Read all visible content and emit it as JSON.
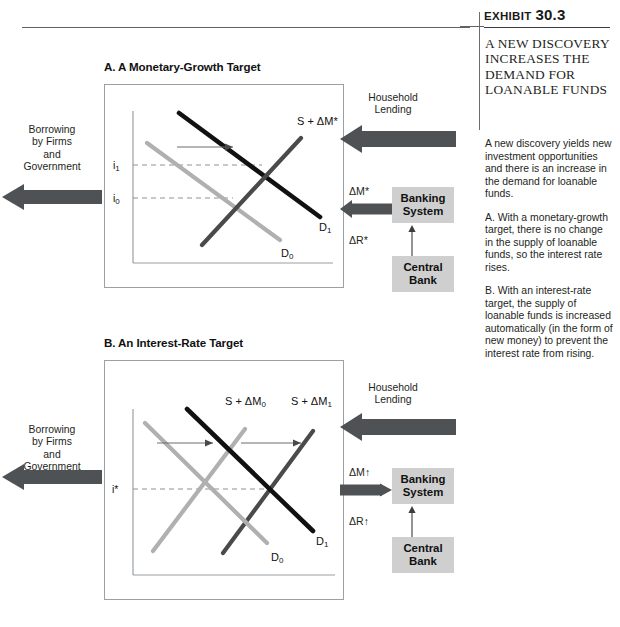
{
  "exhibit": {
    "label": "Exhibit",
    "number": "30.3",
    "title": "A NEW DISCOVERY INCREASES THE DEMAND FOR LOANABLE FUNDS",
    "paragraphs": [
      "A new discovery yields new investment opportunities and there is an increase in the demand for loanable funds.",
      "A. With a monetary-growth target, there is no change in the supply of loanable funds, so the interest rate rises.",
      "B. With an interest-rate target, the supply of loanable funds is increased automatically (in the form of new money) to prevent the interest rate from rising."
    ]
  },
  "panel_a": {
    "title": "A.  A Monetary-Growth Target",
    "left_caption": "Borrowing\nby Firms\nand\nGovernment",
    "flow_caption": "Household\nLending",
    "delta_m": "ΔM*",
    "delta_r": "ΔR*",
    "banking_box": "Banking\nSystem",
    "central_box": "Central\nBank",
    "axis_labels": {
      "i1": "i₁",
      "i0": "i₀"
    },
    "curves": {
      "supply": "S + ΔM*",
      "demand_new": "D₁",
      "demand_old": "D₀"
    }
  },
  "panel_b": {
    "title": "B.  An Interest-Rate Target",
    "left_caption": "Borrowing\nby Firms\nand\nGovernment",
    "flow_caption": "Household\nLending",
    "delta_m": "ΔM↑",
    "delta_r": "ΔR↑",
    "banking_box": "Banking\nSystem",
    "central_box": "Central\nBank",
    "axis_labels": {
      "istar": "i*"
    },
    "curves": {
      "supply_old": "S + ΔM₀",
      "supply_new": "S + ΔM₁",
      "demand_new": "D₁",
      "demand_old": "D₀"
    }
  },
  "chart_data": [
    {
      "type": "line",
      "panel": "A",
      "title": "A.  A Monetary-Growth Target",
      "xlabel": "Loanable funds",
      "ylabel": "Interest rate",
      "grid": false,
      "legend": "inline-curve-labels",
      "annotations": [
        "Demand shifts right from D0 to D1",
        "Interest rate rises from i0 to i1"
      ],
      "yticks": [
        "i₀",
        "i₁"
      ],
      "series": [
        {
          "name": "S + ΔM*",
          "color": "#4a4a4a",
          "points": [
            [
              0.34,
              0.06
            ],
            [
              0.86,
              0.74
            ]
          ]
        },
        {
          "name": "D₀",
          "color": "#b0b0b0",
          "points": [
            [
              0.12,
              0.78
            ],
            [
              0.8,
              0.14
            ]
          ]
        },
        {
          "name": "D₁",
          "color": "#111111",
          "points": [
            [
              0.3,
              0.94
            ],
            [
              0.96,
              0.3
            ]
          ]
        }
      ],
      "equilibria": [
        {
          "label": "initial",
          "x": 0.525,
          "y": 0.445,
          "rate": "i₀"
        },
        {
          "label": "new",
          "x": 0.655,
          "y": 0.612,
          "rate": "i₁"
        }
      ],
      "shift_arrow": {
        "from": [
          0.3,
          0.645
        ],
        "to": [
          0.545,
          0.645
        ]
      }
    },
    {
      "type": "line",
      "panel": "B",
      "title": "B.  An Interest-Rate Target",
      "xlabel": "Loanable funds",
      "ylabel": "Interest rate",
      "grid": false,
      "legend": "inline-curve-labels",
      "annotations": [
        "Demand shifts right from D0 to D1",
        "Supply shifts right from S + ΔM0 to S + ΔM1",
        "Interest rate held constant at i*"
      ],
      "yticks": [
        "i*"
      ],
      "series": [
        {
          "name": "S + ΔM₀",
          "color": "#b0b0b0",
          "points": [
            [
              0.1,
              0.1
            ],
            [
              0.6,
              0.78
            ]
          ]
        },
        {
          "name": "S + ΔM₁",
          "color": "#4a4a4a",
          "points": [
            [
              0.42,
              0.08
            ],
            [
              0.92,
              0.78
            ]
          ]
        },
        {
          "name": "D₀",
          "color": "#b0b0b0",
          "points": [
            [
              0.07,
              0.8
            ],
            [
              0.72,
              0.14
            ]
          ]
        },
        {
          "name": "D₁",
          "color": "#111111",
          "points": [
            [
              0.3,
              0.94
            ],
            [
              0.95,
              0.28
            ]
          ]
        },
        {
          "name": "D₁-lower",
          "color": "#111111",
          "points": [
            [
              0.3,
              0.94
            ],
            [
              0.95,
              0.28
            ]
          ]
        }
      ],
      "equilibria": [
        {
          "label": "initial",
          "x": 0.385,
          "y": 0.485,
          "rate": "i*"
        },
        {
          "label": "new",
          "x": 0.705,
          "y": 0.485,
          "rate": "i*"
        }
      ],
      "shift_arrows": [
        {
          "from": [
            0.16,
            0.655
          ],
          "to": [
            0.4,
            0.655
          ]
        },
        {
          "from": [
            0.5,
            0.655
          ],
          "to": [
            0.8,
            0.655
          ]
        }
      ]
    }
  ],
  "colors": {
    "arrow_dark": "#4e5254",
    "box_gray": "#cfcfcf",
    "curve_black": "#111111",
    "curve_gray": "#b0b0b0",
    "curve_dark_gray": "#4a4a4a",
    "frame": "#9aa0a3",
    "rule": "#5f6365"
  }
}
